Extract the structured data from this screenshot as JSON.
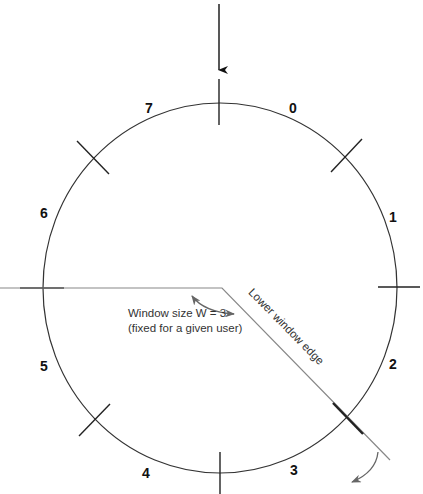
{
  "diagram": {
    "type": "circular sequence-number window",
    "sector_labels": [
      {
        "id": "0",
        "text": "0",
        "x": 289,
        "y": 101
      },
      {
        "id": "1",
        "text": "1",
        "x": 389,
        "y": 210
      },
      {
        "id": "2",
        "text": "2",
        "x": 389,
        "y": 357
      },
      {
        "id": "3",
        "text": "3",
        "x": 290,
        "y": 463
      },
      {
        "id": "4",
        "text": "4",
        "x": 142,
        "y": 466
      },
      {
        "id": "5",
        "text": "5",
        "x": 40,
        "y": 359
      },
      {
        "id": "6",
        "text": "6",
        "x": 40,
        "y": 206
      },
      {
        "id": "7",
        "text": "7",
        "x": 145,
        "y": 101
      }
    ],
    "window_note": {
      "line1": "Window size W = 3",
      "line2": "(fixed for a given user)"
    },
    "edge_label": "Lower window edge",
    "colors": {
      "circle": "#333333",
      "ticks": "#222222",
      "window_line": "#888888",
      "arrows": "#666666"
    }
  }
}
